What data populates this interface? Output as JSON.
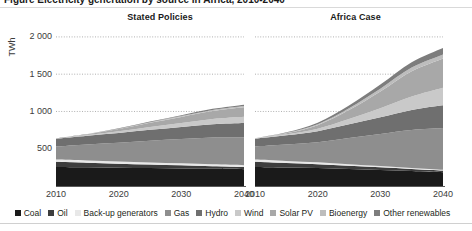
{
  "figure": {
    "cut_title": "Figure  Electricity generation by source in Africa, 2010-2040",
    "ylabel": "TWh"
  },
  "yaxis": {
    "ticks": [
      "2 000",
      "1 500",
      "1 000",
      "500"
    ],
    "values": [
      2000,
      1500,
      1000,
      500
    ],
    "min": 0,
    "max": 2200
  },
  "xaxis": {
    "ticks": [
      "2010",
      "2020",
      "2030",
      "2040"
    ],
    "values": [
      2010,
      2020,
      2030,
      2040
    ]
  },
  "panels": [
    {
      "id": "stated-policies",
      "title": "Stated Policies"
    },
    {
      "id": "africa-case",
      "title": "Africa Case"
    }
  ],
  "legend": [
    {
      "label": "Coal",
      "color": "#1a1a1a"
    },
    {
      "label": "Oil",
      "color": "#3d3d3d"
    },
    {
      "label": "Back-up generators",
      "color": "#e8e8e8"
    },
    {
      "label": "Gas",
      "color": "#8e8e8e"
    },
    {
      "label": "Hydro",
      "color": "#6f6f6f"
    },
    {
      "label": "Wind",
      "color": "#c9c9c9"
    },
    {
      "label": "Solar PV",
      "color": "#a8a8a8"
    },
    {
      "label": "Bioenergy",
      "color": "#bdbdbd"
    },
    {
      "label": "Other renewables",
      "color": "#7d7d7d"
    }
  ],
  "chart_data": {
    "type": "area",
    "title": "Electricity generation by source in Africa",
    "subtitle": "Stacked area, two scenarios",
    "xlabel": "",
    "ylabel": "TWh",
    "ylim": [
      0,
      2200
    ],
    "xlim": [
      2010,
      2040
    ],
    "grid": "horizontal-dotted",
    "legend_position": "bottom",
    "x": [
      2010,
      2015,
      2020,
      2025,
      2030,
      2035,
      2040
    ],
    "panels": [
      {
        "name": "Stated Policies",
        "total": [
          640,
          720,
          790,
          860,
          930,
          1000,
          1035
        ],
        "series": [
          {
            "name": "Coal",
            "color": "#1a1a1a",
            "values": [
              255,
              250,
              245,
              240,
              235,
              230,
              225
            ]
          },
          {
            "name": "Oil",
            "color": "#3d3d3d",
            "values": [
              70,
              62,
              55,
              48,
              42,
              36,
              30
            ]
          },
          {
            "name": "Back-up generators",
            "color": "#e8e8e8",
            "values": [
              30,
              30,
              29,
              28,
              27,
              26,
              25
            ]
          },
          {
            "name": "Gas",
            "color": "#8e8e8e",
            "values": [
              175,
              215,
              250,
              290,
              325,
              360,
              375
            ]
          },
          {
            "name": "Hydro",
            "color": "#6f6f6f",
            "values": [
              105,
              118,
              132,
              148,
              163,
              178,
              190
            ]
          },
          {
            "name": "Wind",
            "color": "#c9c9c9",
            "values": [
              2,
              8,
              22,
              38,
              54,
              70,
              85
            ]
          },
          {
            "name": "Solar PV",
            "color": "#a8a8a8",
            "values": [
              1,
              10,
              30,
              55,
              80,
              105,
              125
            ]
          },
          {
            "name": "Bioenergy",
            "color": "#bdbdbd",
            "values": [
              1,
              3,
              6,
              9,
              12,
              15,
              18
            ]
          },
          {
            "name": "Other renewables",
            "color": "#7d7d7d",
            "values": [
              1,
              3,
              6,
              9,
              12,
              15,
              18
            ]
          }
        ]
      },
      {
        "name": "Africa Case",
        "total": [
          640,
          740,
          860,
          1070,
          1330,
          1600,
          1800
        ],
        "series": [
          {
            "name": "Coal",
            "color": "#1a1a1a",
            "values": [
              255,
              248,
              240,
              228,
              215,
              200,
              185
            ]
          },
          {
            "name": "Oil",
            "color": "#3d3d3d",
            "values": [
              70,
              60,
              52,
              43,
              35,
              28,
              22
            ]
          },
          {
            "name": "Back-up generators",
            "color": "#e8e8e8",
            "values": [
              30,
              28,
              26,
              22,
              18,
              14,
              10
            ]
          },
          {
            "name": "Gas",
            "color": "#8e8e8e",
            "values": [
              175,
              220,
              270,
              350,
              430,
              510,
              560
            ]
          },
          {
            "name": "Hydro",
            "color": "#6f6f6f",
            "values": [
              105,
              125,
              148,
              185,
              225,
              268,
              305
            ]
          },
          {
            "name": "Wind",
            "color": "#c9c9c9",
            "values": [
              2,
              12,
              32,
              70,
              120,
              180,
              235
            ]
          },
          {
            "name": "Solar PV",
            "color": "#a8a8a8",
            "values": [
              1,
              15,
              48,
              120,
              225,
              340,
              395
            ]
          },
          {
            "name": "Bioenergy",
            "color": "#bdbdbd",
            "values": [
              1,
              5,
              14,
              26,
              38,
              48,
              53
            ]
          },
          {
            "name": "Other renewables",
            "color": "#7d7d7d",
            "values": [
              1,
              7,
              20,
              36,
              54,
              72,
              85
            ]
          }
        ]
      }
    ]
  }
}
